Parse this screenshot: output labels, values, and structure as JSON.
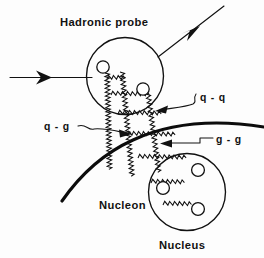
{
  "figure": {
    "kind": "physics-feynman-style-diagram",
    "title_label": "Hadronic probe",
    "labels": {
      "hadronic_probe": "Hadronic probe",
      "q_q": "q - q",
      "q_g": "q - g",
      "g_g": "g - g",
      "nucleon": "Nucleon",
      "nucleus": "Nucleus"
    },
    "colors": {
      "ink": "#111111",
      "thick_ink": "#0c0c0c",
      "background": "#fdfdfd",
      "particle_fill": "#ffffff"
    },
    "label_positions": {
      "hadronic_probe": {
        "x": 60,
        "y": 26
      },
      "q_q": {
        "x": 200,
        "y": 101
      },
      "q_g": {
        "x": 44,
        "y": 129
      },
      "g_g": {
        "x": 216,
        "y": 143
      },
      "nucleon": {
        "x": 99,
        "y": 209
      },
      "nucleus": {
        "x": 159,
        "y": 249
      }
    },
    "shapes": {
      "probe_circle": {
        "cx": 125,
        "cy": 76,
        "r": 38.5
      },
      "nucleus_circle": {
        "cx": 187,
        "cy": 192,
        "r": 38.5
      },
      "probe_partons": [
        {
          "cx": 103,
          "cy": 67,
          "r": 6.2
        },
        {
          "cx": 143,
          "cy": 89,
          "r": 6.2
        }
      ],
      "nucleus_partons": [
        {
          "cx": 198,
          "cy": 170,
          "r": 6.4
        },
        {
          "cx": 163,
          "cy": 188,
          "r": 6.4
        },
        {
          "cx": 198,
          "cy": 209,
          "r": 6.4
        }
      ],
      "incoming_beam": {
        "x1": 10,
        "y1": 77,
        "x2": 92,
        "y2": 77,
        "arrow_at_x": 48
      },
      "outgoing_beam": {
        "x1": 159,
        "y1": 56,
        "x2": 223,
        "y2": 7,
        "arrow_at": {
          "x": 196,
          "y": 30
        }
      },
      "nuclear_surface": "thick arc from (62,200) through (128,141) and (224,122) to (264,127)"
    },
    "ladder": {
      "description": "three parallel gluon/quark zigzag lines running from the hadronic probe down to the nucleus, connected by zigzag rungs",
      "rail_count": 3,
      "rung_count": 6
    },
    "leaders": {
      "q_q": {
        "from": {
          "x": 194,
          "y": 98
        },
        "to": {
          "x": 157,
          "y": 111
        }
      },
      "q_g": {
        "from": {
          "x": 78,
          "y": 126
        },
        "to": {
          "x": 129,
          "y": 134
        }
      },
      "g_g": {
        "from": {
          "x": 212,
          "y": 139
        },
        "to": {
          "x": 160,
          "y": 144
        }
      }
    }
  }
}
